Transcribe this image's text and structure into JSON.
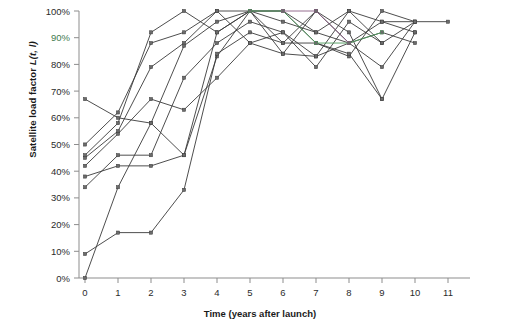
{
  "chart_data": {
    "type": "line",
    "title": "",
    "xlabel": "Time (years after launch)",
    "ylabel": "Satellite load factor L(t, l)",
    "ylabel_prefix": "Satellite load factor ",
    "ylabel_symbol": "L(t, l)",
    "xlim": [
      0,
      11
    ],
    "ylim": [
      0,
      1
    ],
    "grid": false,
    "legend": "none",
    "x_ticks": [
      "0",
      "1",
      "2",
      "3",
      "4",
      "5",
      "6",
      "7",
      "8",
      "9",
      "10",
      "11"
    ],
    "x_tick_values": [
      0,
      1,
      2,
      3,
      4,
      5,
      6,
      7,
      8,
      9,
      10,
      11
    ],
    "y_ticks": [
      "0%",
      "10%",
      "20%",
      "30%",
      "40%",
      "50%",
      "60%",
      "70%",
      "80%",
      "90%",
      "100%"
    ],
    "y_tick_values": [
      0,
      10,
      20,
      30,
      40,
      50,
      60,
      70,
      80,
      90,
      100
    ],
    "y_tick_highlight": "90%",
    "marker": "square",
    "series": [
      {
        "name": "satellite-1",
        "color": "#3a3a3a",
        "x": [
          0,
          1,
          2,
          3,
          4,
          5,
          6,
          7,
          8,
          9,
          10
        ],
        "values": [
          46,
          58,
          92,
          100,
          92,
          100,
          84,
          100,
          88,
          79,
          96
        ]
      },
      {
        "name": "satellite-2",
        "color": "#3a3a3a",
        "x": [
          0,
          1,
          2,
          3,
          4,
          5,
          6,
          7,
          8,
          9,
          10
        ],
        "values": [
          50,
          62,
          88,
          92,
          100,
          88,
          92,
          83,
          100,
          96,
          92
        ]
      },
      {
        "name": "satellite-3",
        "color": "#3a3a3a",
        "x": [
          0,
          1,
          2,
          3,
          4,
          5,
          6,
          7,
          8,
          9,
          10
        ],
        "values": [
          45,
          55,
          79,
          88,
          100,
          100,
          88,
          88,
          83,
          100,
          96
        ]
      },
      {
        "name": "satellite-4",
        "color": "#3a3a3a",
        "x": [
          0,
          1,
          2,
          3,
          4,
          5,
          6,
          7,
          8,
          9,
          10,
          11
        ],
        "values": [
          67,
          60,
          58,
          46,
          83,
          100,
          96,
          92,
          88,
          96,
          96,
          96
        ]
      },
      {
        "name": "satellite-5",
        "color": "#3a3a3a",
        "x": [
          0,
          1,
          2,
          3,
          4,
          5,
          6,
          7,
          8,
          9,
          10
        ],
        "values": [
          42,
          54,
          67,
          63,
          75,
          88,
          84,
          83,
          88,
          92,
          88
        ]
      },
      {
        "name": "satellite-6",
        "color": "#3a3a3a",
        "x": [
          0,
          1,
          2,
          3,
          4,
          5,
          6,
          7,
          8,
          9,
          10
        ],
        "values": [
          38,
          42,
          42,
          46,
          92,
          100,
          100,
          88,
          84,
          67,
          92
        ]
      },
      {
        "name": "satellite-7",
        "color": "#3a3a3a",
        "x": [
          0,
          1,
          2,
          3,
          4,
          5,
          6,
          7,
          8,
          9,
          10
        ],
        "values": [
          34,
          46,
          46,
          75,
          88,
          96,
          92,
          79,
          96,
          88,
          96
        ]
      },
      {
        "name": "satellite-8",
        "color": "#3a3a3a",
        "x": [
          0,
          1,
          2,
          3,
          4,
          5,
          6,
          7,
          8,
          9
        ],
        "values": [
          9,
          17,
          17,
          33,
          84,
          92,
          88,
          100,
          92,
          67
        ]
      },
      {
        "name": "satellite-9",
        "color": "#3a3a3a",
        "x": [
          0,
          1,
          2,
          3,
          4,
          5,
          6,
          7,
          8,
          9
        ],
        "values": [
          0,
          34,
          58,
          87,
          96,
          100,
          100,
          92,
          100,
          88
        ]
      },
      {
        "name": "satellite-10-green",
        "color": "#4f9c5e",
        "x": [
          5,
          6,
          7,
          8,
          9
        ],
        "values": [
          100,
          100,
          88,
          88,
          92
        ]
      },
      {
        "name": "satellite-11-purple",
        "color": "#8a5f84",
        "x": [
          6,
          7,
          8
        ],
        "values": [
          100,
          100,
          88
        ]
      }
    ]
  }
}
